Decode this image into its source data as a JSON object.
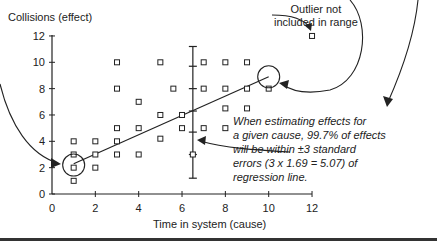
{
  "chart_data": {
    "type": "scatter",
    "title": "",
    "xlabel": "Time in system (cause)",
    "ylabel": "Collisions (effect)",
    "xlim": [
      0,
      12
    ],
    "ylim": [
      0,
      12
    ],
    "xticks": [
      0,
      2,
      4,
      6,
      8,
      10,
      12
    ],
    "yticks": [
      0,
      2,
      4,
      6,
      8,
      10,
      12
    ],
    "grid": false,
    "series": [
      {
        "name": "Observations",
        "marker": "open-square",
        "points": [
          [
            1,
            1
          ],
          [
            1,
            2
          ],
          [
            1,
            3
          ],
          [
            1,
            4
          ],
          [
            2,
            2
          ],
          [
            2,
            3
          ],
          [
            2,
            4
          ],
          [
            3,
            3
          ],
          [
            3,
            4
          ],
          [
            3,
            5
          ],
          [
            3,
            8
          ],
          [
            3,
            10
          ],
          [
            4,
            3
          ],
          [
            4,
            5
          ],
          [
            4,
            7
          ],
          [
            5,
            4.2
          ],
          [
            5,
            6
          ],
          [
            5,
            10
          ],
          [
            5.6,
            8
          ],
          [
            6,
            5
          ],
          [
            6,
            6
          ],
          [
            6.5,
            3
          ],
          [
            7,
            5
          ],
          [
            7,
            8
          ],
          [
            7,
            10
          ],
          [
            8,
            5
          ],
          [
            8,
            6.5
          ],
          [
            8,
            8
          ],
          [
            8,
            10
          ],
          [
            9,
            6.5
          ],
          [
            9,
            8
          ],
          [
            9,
            10
          ],
          [
            10,
            8
          ],
          [
            12,
            12
          ]
        ]
      }
    ],
    "regression_line": {
      "x": [
        1,
        10
      ],
      "y": [
        2.3,
        8.9
      ]
    },
    "prediction_interval": {
      "x": 6.5,
      "y_low": 1.2,
      "y_high": 11.2,
      "ticks": [
        1.2,
        3.0,
        4.7,
        6.3,
        8.0,
        9.7,
        11.2
      ]
    },
    "circled_points": [
      [
        1,
        2.2
      ],
      [
        10,
        8.9
      ]
    ],
    "outlier": [
      12,
      12
    ],
    "annotations": [
      {
        "text": "Outlier not included in range",
        "target": [
          12,
          12
        ]
      },
      {
        "text": "When estimating effects for a given cause, 99.7% of effects will be within ±3 standard errors (3 x 1.69 = 5.07) of regression line.",
        "target": "prediction-interval"
      }
    ]
  },
  "labels": {
    "ylabel": "Collisions (effect)",
    "xlabel": "Time in system (cause)",
    "outlier_line1": "Outlier not",
    "outlier_line2": "included in range",
    "note_line1": "When estimating effects for",
    "note_line2": "a given cause, 99.7% of effects",
    "note_line3": "will be within ±3 standard",
    "note_line4": "errors (3 x 1.69 = 5.07) of",
    "note_line5": "regression line."
  },
  "colors": {
    "ink": "#222222",
    "background": "#ffffff"
  }
}
